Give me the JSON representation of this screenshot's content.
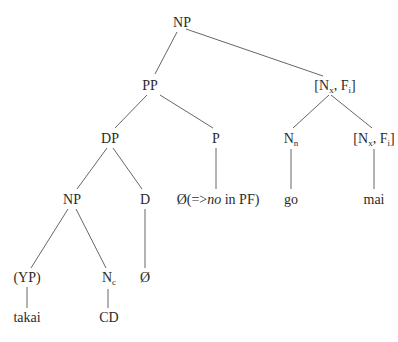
{
  "diagram": {
    "type": "syntax-tree",
    "nodes": [
      {
        "id": "np_root",
        "label": "NP",
        "sub": "",
        "parent": null
      },
      {
        "id": "pp",
        "label": "PP",
        "sub": "",
        "parent": "np_root"
      },
      {
        "id": "nxfi_top",
        "label": "[N",
        "sub": "x",
        "label2": ", F",
        "sub2": "i",
        "label3": "]",
        "parent": "np_root"
      },
      {
        "id": "dp",
        "label": "DP",
        "sub": "",
        "parent": "pp"
      },
      {
        "id": "p",
        "label": "P",
        "sub": "",
        "parent": "pp"
      },
      {
        "id": "nn",
        "label": "N",
        "sub": "n",
        "parent": "nxfi_top"
      },
      {
        "id": "nxfi_low",
        "label": "[N",
        "sub": "x",
        "label2": ", F",
        "sub2": "i",
        "label3": "]",
        "parent": "nxfi_top"
      },
      {
        "id": "np_inner",
        "label": "NP",
        "sub": "",
        "parent": "dp"
      },
      {
        "id": "d",
        "label": "D",
        "sub": "",
        "parent": "dp"
      },
      {
        "id": "p_null",
        "label": "Ø(=>",
        "italic": "no",
        "label2": " in PF)",
        "parent": "p"
      },
      {
        "id": "go",
        "label": "go",
        "sub": "",
        "parent": "nn"
      },
      {
        "id": "mai",
        "label": "mai",
        "sub": "",
        "parent": "nxfi_low"
      },
      {
        "id": "yp",
        "label": "(YP)",
        "sub": "",
        "parent": "np_inner"
      },
      {
        "id": "nc",
        "label": "N",
        "sub": "c",
        "parent": "np_inner"
      },
      {
        "id": "d_null",
        "label": "Ø",
        "sub": "",
        "parent": "d"
      },
      {
        "id": "takai",
        "label": "takai",
        "sub": "",
        "parent": "yp"
      },
      {
        "id": "cd",
        "label": "CD",
        "sub": "",
        "parent": "nc"
      }
    ]
  }
}
